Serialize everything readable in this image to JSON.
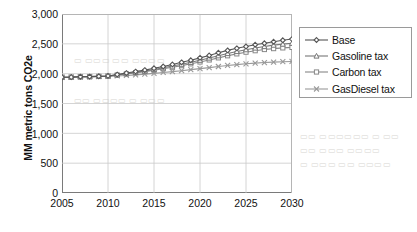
{
  "chart_data": {
    "type": "line",
    "title": "",
    "xlabel": "",
    "ylabel": "MM metric tons CO2e",
    "xlim": [
      2005,
      2030
    ],
    "ylim": [
      0,
      3000
    ],
    "grid": true,
    "legend_position": "right",
    "x_ticks": [
      "2005",
      "2010",
      "2015",
      "2020",
      "2025",
      "2030"
    ],
    "y_ticks": [
      "0",
      "500",
      "1,000",
      "1,500",
      "2,000",
      "2,500",
      "3,000"
    ],
    "x": [
      2005,
      2006,
      2007,
      2008,
      2009,
      2010,
      2011,
      2012,
      2013,
      2014,
      2015,
      2016,
      2017,
      2018,
      2019,
      2020,
      2021,
      2022,
      2023,
      2024,
      2025,
      2026,
      2027,
      2028,
      2029,
      2030
    ],
    "series": [
      {
        "name": "Base",
        "marker": "diamond",
        "color": "#555555",
        "values": [
          1940,
          1942,
          1948,
          1950,
          1955,
          1962,
          1985,
          2010,
          2035,
          2060,
          2090,
          2120,
          2155,
          2190,
          2225,
          2265,
          2305,
          2350,
          2390,
          2425,
          2455,
          2485,
          2510,
          2535,
          2560,
          2580
        ]
      },
      {
        "name": "Gasoline tax",
        "marker": "triangle",
        "color": "#777777",
        "values": [
          1940,
          1942,
          1948,
          1950,
          1955,
          1962,
          1980,
          2000,
          2022,
          2045,
          2070,
          2098,
          2128,
          2158,
          2190,
          2225,
          2262,
          2300,
          2338,
          2372,
          2402,
          2430,
          2455,
          2478,
          2495,
          2510
        ]
      },
      {
        "name": "Carbon tax",
        "marker": "square",
        "color": "#888888",
        "values": [
          1940,
          1942,
          1948,
          1950,
          1955,
          1962,
          1978,
          1996,
          2015,
          2035,
          2058,
          2082,
          2108,
          2135,
          2165,
          2196,
          2230,
          2265,
          2300,
          2332,
          2360,
          2385,
          2405,
          2420,
          2432,
          2440
        ]
      },
      {
        "name": "GasDiesel tax",
        "marker": "x",
        "color": "#999999",
        "values": [
          1940,
          1942,
          1948,
          1950,
          1952,
          1955,
          1962,
          1970,
          1980,
          1992,
          2005,
          2020,
          2035,
          2050,
          2068,
          2085,
          2102,
          2120,
          2138,
          2152,
          2165,
          2176,
          2186,
          2194,
          2200,
          2205
        ]
      }
    ]
  },
  "background_text": {
    "note_1": "",
    "note_2": "",
    "note_3": ""
  }
}
